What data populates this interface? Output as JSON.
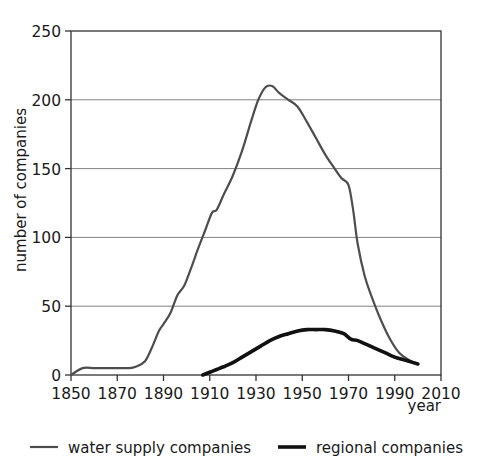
{
  "chart_data": {
    "type": "line",
    "title": "",
    "xlabel": "year",
    "ylabel": "number of companies",
    "xlim": [
      1850,
      2010
    ],
    "ylim": [
      0,
      250
    ],
    "xticks": [
      1850,
      1870,
      1890,
      1910,
      1930,
      1950,
      1970,
      1990,
      2010
    ],
    "yticks": [
      0,
      50,
      100,
      150,
      200,
      250
    ],
    "grid": "horizontal",
    "legend_position": "bottom",
    "series": [
      {
        "name": "water supply companies",
        "color": "#4d4d4d",
        "line_width": 2.2,
        "x": [
          1850,
          1855,
          1860,
          1865,
          1870,
          1875,
          1878,
          1882,
          1885,
          1888,
          1890,
          1893,
          1896,
          1899,
          1902,
          1905,
          1908,
          1911,
          1913,
          1916,
          1920,
          1924,
          1928,
          1931,
          1934,
          1937,
          1940,
          1944,
          1948,
          1952,
          1956,
          1960,
          1964,
          1967,
          1970,
          1972,
          1974,
          1977,
          1980,
          1984,
          1988,
          1992,
          1996,
          2000
        ],
        "y": [
          0,
          5,
          5,
          5,
          5,
          5,
          6,
          10,
          20,
          32,
          37,
          45,
          58,
          65,
          78,
          92,
          105,
          118,
          120,
          131,
          145,
          163,
          185,
          200,
          209,
          210,
          205,
          200,
          195,
          184,
          172,
          160,
          150,
          143,
          138,
          120,
          95,
          72,
          57,
          40,
          26,
          16,
          11,
          8
        ]
      },
      {
        "name": "regional companies",
        "color": "#111111",
        "line_width": 3.6,
        "x": [
          1907,
          1910,
          1913,
          1916,
          1920,
          1924,
          1928,
          1932,
          1936,
          1940,
          1944,
          1948,
          1952,
          1956,
          1960,
          1964,
          1968,
          1971,
          1974,
          1978,
          1982,
          1986,
          1990,
          1994,
          1998,
          2000
        ],
        "y": [
          0,
          2,
          4,
          6,
          9,
          13,
          17,
          21,
          25,
          28,
          30,
          32,
          33,
          33,
          33,
          32,
          30,
          26,
          25,
          22,
          19,
          16,
          13,
          11,
          9,
          8
        ]
      }
    ]
  },
  "axes": {
    "y_axis_title": "number of companies",
    "x_axis_title": "year",
    "y_tick_labels": [
      "250",
      "200",
      "150",
      "100",
      "50",
      "0"
    ],
    "x_tick_labels": [
      "1850",
      "1870",
      "1890",
      "1910",
      "1930",
      "1950",
      "1970",
      "1990",
      "2010"
    ]
  },
  "legend": {
    "items": [
      {
        "label": "water supply companies",
        "color": "#4d4d4d"
      },
      {
        "label": "regional companies",
        "color": "#111111"
      }
    ]
  },
  "colors": {
    "axis": "#333333",
    "grid": "#808080",
    "background": "#ffffff"
  }
}
